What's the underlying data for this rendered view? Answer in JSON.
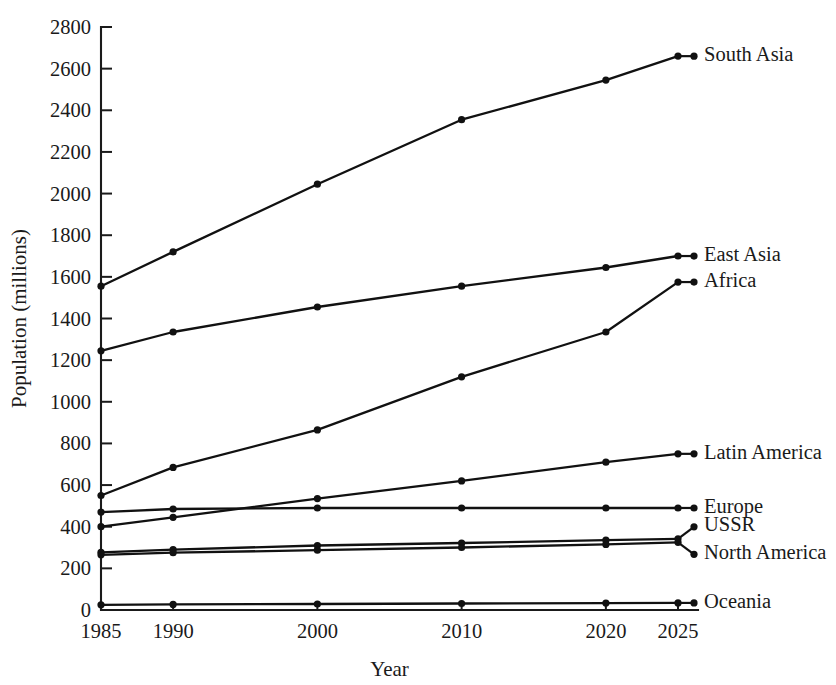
{
  "chart_data": {
    "type": "line",
    "title": "",
    "xlabel": "Year",
    "ylabel": "Population (millions)",
    "x": [
      1985,
      1990,
      2000,
      2010,
      2020,
      2025
    ],
    "xtick_labels": [
      "1985",
      "1990",
      "2000",
      "2010",
      "2020",
      "2025"
    ],
    "ytick_labels": [
      "0",
      "200",
      "400",
      "600",
      "800",
      "1000",
      "1200",
      "1400",
      "1600",
      "1800",
      "2000",
      "2200",
      "2400",
      "2600",
      "2800"
    ],
    "ytick_values": [
      0,
      200,
      400,
      600,
      800,
      1000,
      1200,
      1400,
      1600,
      1800,
      2000,
      2200,
      2400,
      2600,
      2800
    ],
    "xlim": [
      1985,
      2025
    ],
    "ylim": [
      0,
      2800
    ],
    "grid": false,
    "legend_position": "right-inline-labels",
    "marker": "filled-circle",
    "line_color": "#111111",
    "series": [
      {
        "name": "South Asia",
        "label": "South Asia",
        "values": [
          1555,
          1720,
          2045,
          2355,
          2545,
          2660
        ]
      },
      {
        "name": "East Asia",
        "label": "East Asia",
        "values": [
          1245,
          1335,
          1455,
          1555,
          1645,
          1700
        ]
      },
      {
        "name": "Africa",
        "label": "Africa",
        "values": [
          550,
          685,
          865,
          1120,
          1335,
          1575
        ]
      },
      {
        "name": "Latin America",
        "label": "Latin America",
        "values": [
          400,
          445,
          535,
          620,
          710,
          750
        ]
      },
      {
        "name": "Europe",
        "label": "Europe",
        "values": [
          470,
          485,
          490,
          490,
          490,
          490
        ]
      },
      {
        "name": "USSR",
        "label": "USSR",
        "values": [
          277,
          290,
          310,
          322,
          335,
          342
        ]
      },
      {
        "name": "North America",
        "label": "North America",
        "values": [
          265,
          275,
          287,
          300,
          315,
          325
        ]
      },
      {
        "name": "Oceania",
        "label": "Oceania",
        "values": [
          25,
          27,
          29,
          31,
          33,
          34
        ]
      }
    ],
    "label_y_offsets": {
      "South Asia": 0,
      "East Asia": 0,
      "Africa": 0,
      "Latin America": 0,
      "Europe": 0,
      "USSR": -12,
      "North America": 12,
      "Oceania": 0
    }
  }
}
